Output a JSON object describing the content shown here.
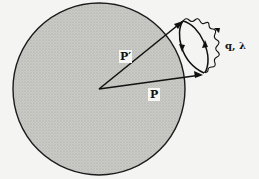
{
  "diagram": {
    "type": "feynman-style momentum diagram",
    "sphere": {
      "fill_color": "#c4c4c0",
      "border_color": "#1a1a1a",
      "description": "shaded disk (Fermi sphere)"
    },
    "vectors": [
      {
        "id": "p_prime",
        "label": "P′",
        "from": "center",
        "to": "loop-top"
      },
      {
        "id": "p",
        "label": "P",
        "from": "center",
        "to": "loop-bottom"
      }
    ],
    "loop": {
      "description": "fermion loop with opposite arrows, attached to wavy photon line"
    },
    "photon": {
      "label": "q, λ"
    }
  },
  "labels": {
    "p_prime": "P′",
    "p": "P",
    "photon": "q, λ"
  }
}
